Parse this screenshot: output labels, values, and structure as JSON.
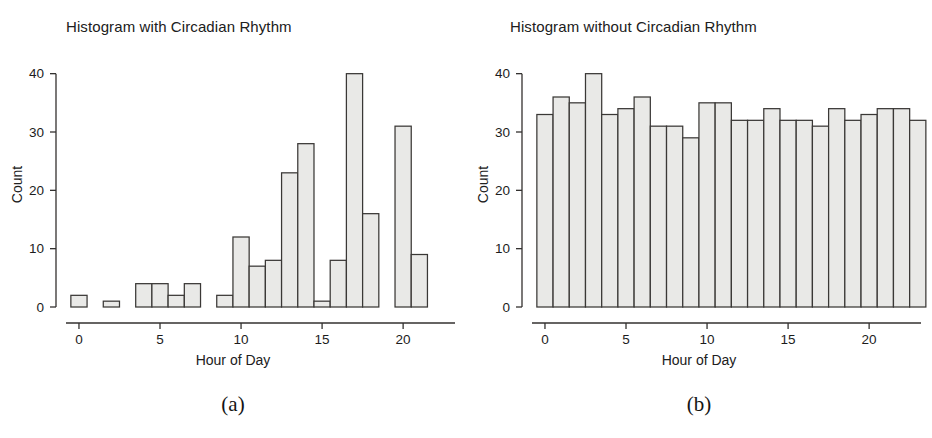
{
  "figure": {
    "caption_left": "(a)",
    "caption_right": "(b)",
    "bar_fill": "#e9e9e7",
    "bar_stroke": "#3a3836",
    "axis_color": "#33312f",
    "background": "#ffffff"
  },
  "chart_data": [
    {
      "panel": "a",
      "type": "bar",
      "title": "Histogram with Circadian Rhythm",
      "xlabel": "Hour of Day",
      "ylabel": "Count",
      "categories": [
        0,
        1,
        2,
        3,
        4,
        5,
        6,
        7,
        8,
        9,
        10,
        11,
        12,
        13,
        14,
        15,
        16,
        17,
        18,
        19,
        20,
        21,
        22,
        23
      ],
      "values": [
        2,
        0,
        1,
        0,
        4,
        4,
        2,
        4,
        0,
        2,
        12,
        7,
        8,
        23,
        28,
        1,
        8,
        40,
        16,
        0,
        31,
        9,
        0,
        0
      ],
      "xlim": [
        -0.8,
        23.2
      ],
      "ylim": [
        0,
        42
      ],
      "xticks": [
        0,
        5,
        10,
        15,
        20
      ],
      "yticks": [
        0,
        10,
        20,
        30,
        40
      ],
      "grid": false,
      "legend": "none"
    },
    {
      "panel": "b",
      "type": "bar",
      "title": "Histogram without Circadian Rhythm",
      "xlabel": "Hour of Day",
      "ylabel": "Count",
      "categories": [
        0,
        1,
        2,
        3,
        4,
        5,
        6,
        7,
        8,
        9,
        10,
        11,
        12,
        13,
        14,
        15,
        16,
        17,
        18,
        19,
        20,
        21,
        22,
        23
      ],
      "values": [
        33,
        36,
        35,
        40,
        33,
        34,
        36,
        31,
        31,
        29,
        35,
        35,
        32,
        32,
        34,
        32,
        32,
        31,
        34,
        32,
        33,
        34,
        34,
        32
      ],
      "xlim": [
        -0.8,
        23.2
      ],
      "ylim": [
        0,
        42
      ],
      "xticks": [
        0,
        5,
        10,
        15,
        20
      ],
      "yticks": [
        0,
        10,
        20,
        30,
        40
      ],
      "grid": false,
      "legend": "none"
    }
  ]
}
